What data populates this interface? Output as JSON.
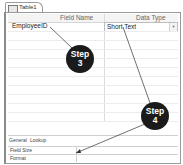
{
  "document_tab": {
    "label": "Table1",
    "icon": "table-icon"
  },
  "grid": {
    "columns": [
      "Field Name",
      "Data Type"
    ],
    "rows": [
      {
        "field_name": "EmployeeID",
        "data_type": "Short Text"
      }
    ]
  },
  "properties": {
    "tabs": [
      "General",
      "Lookup"
    ],
    "rows": [
      {
        "label": "Field Size",
        "value": ""
      },
      {
        "label": "Format",
        "value": ""
      }
    ]
  },
  "callouts": [
    {
      "line1": "Step",
      "line2": "3"
    },
    {
      "line1": "Step",
      "line2": "4"
    }
  ],
  "colors": {
    "callout_bg": "#1b1b1b",
    "callout_text": "#ffffff",
    "border": "#9a9a9a"
  }
}
